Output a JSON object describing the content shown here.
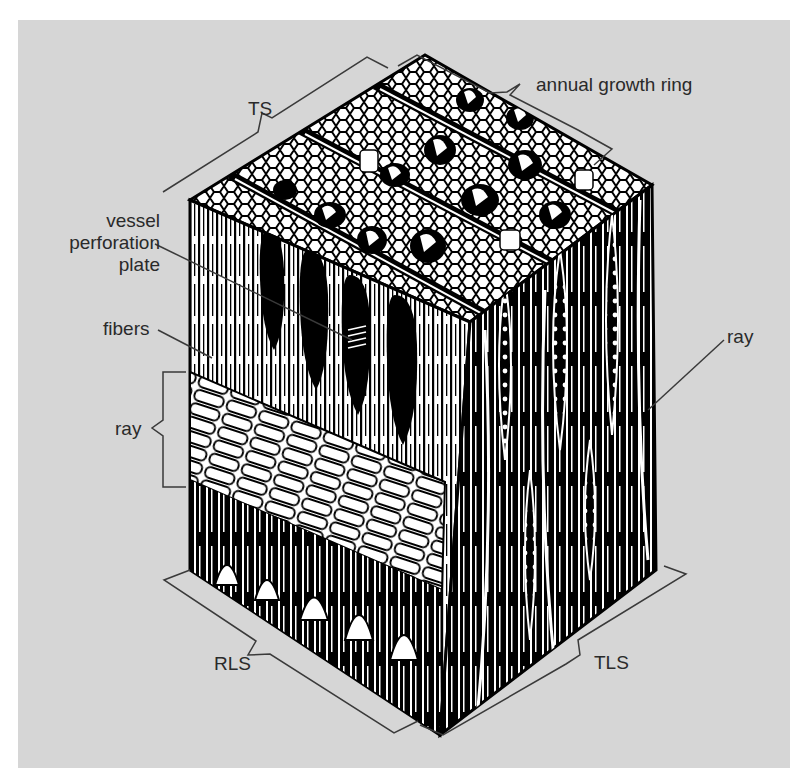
{
  "figure": {
    "background_color": "#d6d6d6",
    "ink_color": "#000000",
    "label_color": "#2a2a2a"
  },
  "labels": {
    "ts": "TS",
    "annual_growth_ring": "annual growth ring",
    "vessel_perforation_plate": [
      "vessel",
      "perforation",
      "plate"
    ],
    "fibers": "fibers",
    "ray_left": "ray",
    "ray_right": "ray",
    "rls": "RLS",
    "tls": "TLS"
  },
  "faces": [
    {
      "id": "TS",
      "name": "transverse section",
      "position": "top"
    },
    {
      "id": "RLS",
      "name": "radial longitudinal section",
      "position": "front-left"
    },
    {
      "id": "TLS",
      "name": "tangential longitudinal section",
      "position": "front-right"
    }
  ]
}
